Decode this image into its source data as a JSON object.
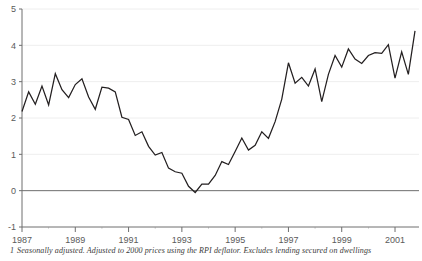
{
  "footnote": {
    "marker": "1",
    "text": "Seasonally adjusted. Adjusted to 2000 prices using the RPI deflator. Excludes lending secured on dwellings"
  },
  "colors": {
    "line": "#231f20",
    "gridline": "#eeeeee",
    "axis": "#6e6e6e",
    "zero_line": "#6e6e6e",
    "tick_text": "#5a5a5a",
    "background": "#ffffff"
  },
  "chart_data": {
    "type": "line",
    "title": "",
    "subtitle": "",
    "xlabel": "",
    "ylabel": "",
    "xlim": [
      1987.0,
      2001.9
    ],
    "ylim": [
      -1,
      5
    ],
    "grid": true,
    "grid_axis": "y",
    "legend_position": "none",
    "y_ticks": [
      -1,
      0,
      1,
      2,
      3,
      4,
      5
    ],
    "y_tick_labels": [
      "-1",
      "0",
      "1",
      "2",
      "3",
      "4",
      "5"
    ],
    "x_ticks": [
      1987,
      1989,
      1991,
      1993,
      1995,
      1997,
      1999,
      2001
    ],
    "x_tick_labels": [
      "1987",
      "1989",
      "1991",
      "1993",
      "1995",
      "1997",
      "1999",
      "2001"
    ],
    "x_minor_interval": 1,
    "zero_line": 0,
    "series": [
      {
        "name": "Growth rate",
        "x": [
          1987.0,
          1987.25,
          1987.5,
          1987.75,
          1988.0,
          1988.25,
          1988.5,
          1988.75,
          1989.0,
          1989.25,
          1989.5,
          1989.75,
          1990.0,
          1990.25,
          1990.5,
          1990.75,
          1991.0,
          1991.25,
          1991.5,
          1991.75,
          1992.0,
          1992.25,
          1992.5,
          1992.75,
          1993.0,
          1993.25,
          1993.5,
          1993.75,
          1994.0,
          1994.25,
          1994.5,
          1994.75,
          1995.0,
          1995.25,
          1995.5,
          1995.75,
          1996.0,
          1996.25,
          1996.5,
          1996.75,
          1997.0,
          1997.25,
          1997.5,
          1997.75,
          1998.0,
          1998.25,
          1998.5,
          1998.75,
          1999.0,
          1999.25,
          1999.5,
          1999.75,
          2000.0,
          2000.25,
          2000.5,
          2000.75,
          2001.0,
          2001.25,
          2001.5,
          2001.75
        ],
        "values": [
          2.18,
          2.72,
          2.38,
          2.88,
          2.36,
          3.22,
          2.78,
          2.56,
          2.92,
          3.08,
          2.58,
          2.24,
          2.85,
          2.82,
          2.72,
          2.02,
          1.96,
          1.52,
          1.62,
          1.22,
          0.98,
          1.05,
          0.62,
          0.52,
          0.48,
          0.12,
          -0.05,
          0.18,
          0.18,
          0.42,
          0.8,
          0.72,
          1.08,
          1.45,
          1.12,
          1.25,
          1.62,
          1.44,
          1.9,
          2.52,
          3.52,
          2.96,
          3.12,
          2.88,
          3.35,
          2.45,
          3.2,
          3.72,
          3.4,
          3.9,
          3.62,
          3.5,
          3.72,
          3.8,
          3.78,
          4.02,
          3.1,
          3.82,
          3.2,
          4.4
        ]
      }
    ]
  }
}
